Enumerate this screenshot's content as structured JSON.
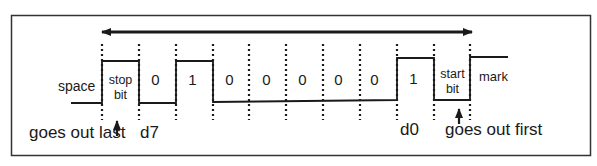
{
  "diagram": {
    "type": "serial-frame-timing",
    "colors": {
      "line": "#1a1a1a",
      "background": "#ffffff",
      "frame": "#333333"
    },
    "direction_arrow": "bidirectional",
    "labels": {
      "space": "space",
      "mark": "mark",
      "stop_bit_line1": "stop",
      "stop_bit_line2": "bit",
      "start_bit_line1": "start",
      "start_bit_line2": "bit",
      "goes_out_last": "goes out last",
      "goes_out_first": "goes out first",
      "d7": "d7",
      "d0": "d0"
    },
    "bits": [
      {
        "position": "d7",
        "value": "0"
      },
      {
        "position": "d6",
        "value": "1"
      },
      {
        "position": "d5",
        "value": "0"
      },
      {
        "position": "d4",
        "value": "0"
      },
      {
        "position": "d3",
        "value": "0"
      },
      {
        "position": "d2",
        "value": "0"
      },
      {
        "position": "d1",
        "value": "0"
      },
      {
        "position": "d0",
        "value": "1"
      }
    ]
  }
}
